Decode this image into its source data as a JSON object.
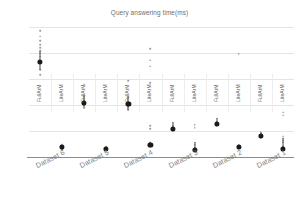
{
  "chart_data": {
    "type": "scatter",
    "title": "Query answering time(ms)",
    "xlabel": "",
    "ylabel": "",
    "ylim": [
      0,
      2500
    ],
    "yticks": [
      0,
      500,
      1000,
      1500,
      2000,
      2500
    ],
    "grid": true,
    "legend": "none",
    "categories": [
      "Dataset 6",
      "Dataset 5",
      "Dataset 4",
      "Dataset 3",
      "Dataset 2",
      "Dataset 1"
    ],
    "series_names": [
      "FullArM",
      "LiteArM"
    ],
    "columns": [
      {
        "dataset": "Dataset 6",
        "series": "FullArM",
        "mean": 1850,
        "points": [
          2450,
          2340,
          2250,
          2180,
          2120,
          2060,
          2010,
          1960,
          1850,
          1700,
          1600
        ]
      },
      {
        "dataset": "Dataset 6",
        "series": "LiteArM",
        "mean": 210,
        "points": [
          260,
          230,
          210,
          190,
          160
        ]
      },
      {
        "dataset": "Dataset 5",
        "series": "FullArM",
        "mean": 1060,
        "points": [
          1420,
          1200,
          1100,
          1060,
          1010,
          960
        ]
      },
      {
        "dataset": "Dataset 5",
        "series": "LiteArM",
        "mean": 175,
        "points": [
          220,
          190,
          175,
          150
        ]
      },
      {
        "dataset": "Dataset 4",
        "series": "FullArM",
        "mean": 1030,
        "points": [
          1480,
          1180,
          1090,
          1030,
          980,
          930
        ]
      },
      {
        "dataset": "Dataset 4",
        "series": "LiteArM",
        "mean": 250,
        "points": [
          2100,
          1880,
          1760,
          1450,
          620,
          560,
          300,
          260,
          250,
          220
        ]
      },
      {
        "dataset": "Dataset 3",
        "series": "FullArM",
        "mean": 560,
        "points": [
          690,
          620,
          580,
          560,
          520
        ]
      },
      {
        "dataset": "Dataset 3",
        "series": "LiteArM",
        "mean": 160,
        "points": [
          640,
          580,
          300,
          250,
          200,
          170,
          160,
          140
        ]
      },
      {
        "dataset": "Dataset 2",
        "series": "FullArM",
        "mean": 650,
        "points": [
          760,
          700,
          670,
          650,
          610
        ]
      },
      {
        "dataset": "Dataset 2",
        "series": "LiteArM",
        "mean": 205,
        "points": [
          2000,
          250,
          225,
          205,
          180
        ]
      },
      {
        "dataset": "Dataset 1",
        "series": "FullArM",
        "mean": 420,
        "points": [
          510,
          470,
          440,
          420,
          390
        ]
      },
      {
        "dataset": "Dataset 1",
        "series": "LiteArM",
        "mean": 175,
        "points": [
          880,
          820,
          420,
          380,
          340,
          300,
          220,
          190,
          175,
          150
        ]
      }
    ]
  },
  "colors": {
    "mean_marker": "#1a1a1a",
    "point": "#9b9b9b",
    "gridline": "#e4e4e4",
    "axis": "#8c8c8c",
    "tick_text": "#9a9a9a",
    "title_text": "#6e6e6e",
    "background": "#ffffff"
  }
}
